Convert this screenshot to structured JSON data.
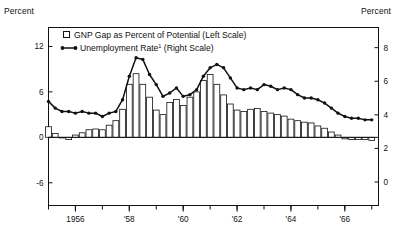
{
  "axis_titles": {
    "left": "Percent",
    "right": "Percent"
  },
  "legend": {
    "items": [
      {
        "label": "GNP Gap as Percent of Potential (Left Scale)",
        "marker": "open-square-icon",
        "color": "#ffffff"
      },
      {
        "label": "Unemployment Rate",
        "footnote": "1",
        "label_tail": " (Right Scale)",
        "marker": "line-with-dots-icon",
        "color": "#111111"
      }
    ]
  },
  "colors": {
    "axis": "#111111",
    "bar_stroke": "#111111",
    "bar_fill": "#ffffff",
    "line": "#111111",
    "marker": "#111111"
  },
  "chart_data": {
    "type": "bar",
    "title": "",
    "xlabel": "",
    "ylabel": "Percent",
    "grid": false,
    "legend_position": "top-left",
    "x_tick_labels": [
      "1956",
      "'58",
      "'60",
      "'62",
      "'64",
      "'66"
    ],
    "x_tick_years": [
      1956,
      1958,
      1960,
      1962,
      1964,
      1966
    ],
    "x_range": [
      1955.0,
      1967.25
    ],
    "left_axis": {
      "label": "GNP Gap as Percent of Potential",
      "ticks": [
        12,
        6,
        0,
        -6
      ],
      "ylim": [
        -9,
        14.5
      ]
    },
    "right_axis": {
      "label": "Unemployment Rate",
      "ticks": [
        8,
        6,
        4,
        2,
        0
      ],
      "ylim": [
        -1.4,
        9.2
      ]
    },
    "x": [
      1955.0,
      1955.25,
      1955.5,
      1955.75,
      1956.0,
      1956.25,
      1956.5,
      1956.75,
      1957.0,
      1957.25,
      1957.5,
      1957.75,
      1958.0,
      1958.25,
      1958.5,
      1958.75,
      1959.0,
      1959.25,
      1959.5,
      1959.75,
      1960.0,
      1960.25,
      1960.5,
      1960.75,
      1961.0,
      1961.25,
      1961.5,
      1961.75,
      1962.0,
      1962.25,
      1962.5,
      1962.75,
      1963.0,
      1963.25,
      1963.5,
      1963.75,
      1964.0,
      1964.25,
      1964.5,
      1964.75,
      1965.0,
      1965.25,
      1965.5,
      1965.75,
      1966.0,
      1966.25,
      1966.5,
      1966.75,
      1967.0
    ],
    "series": [
      {
        "name": "GNP Gap as Percent of Potential (Left Scale)",
        "type": "bar",
        "axis": "left",
        "values": [
          1.4,
          0.5,
          0.0,
          -0.3,
          0.3,
          0.6,
          1.0,
          1.1,
          1.0,
          1.6,
          2.2,
          3.7,
          7.0,
          8.4,
          7.0,
          5.3,
          3.6,
          3.0,
          4.6,
          5.0,
          4.2,
          5.3,
          6.0,
          7.5,
          8.3,
          7.0,
          5.6,
          4.4,
          3.6,
          3.4,
          3.7,
          3.8,
          3.4,
          3.2,
          3.0,
          2.8,
          2.4,
          2.2,
          2.0,
          1.9,
          1.5,
          1.2,
          0.7,
          0.3,
          -0.2,
          -0.3,
          -0.3,
          -0.3,
          -0.4
        ]
      },
      {
        "name": "Unemployment Rate (Right Scale)",
        "type": "line",
        "axis": "right",
        "values": [
          4.8,
          4.4,
          4.2,
          4.2,
          4.1,
          4.2,
          4.1,
          4.1,
          3.9,
          4.1,
          4.2,
          4.9,
          6.3,
          7.4,
          7.3,
          6.4,
          5.8,
          5.1,
          5.3,
          5.6,
          5.1,
          5.2,
          5.5,
          6.3,
          6.8,
          7.0,
          6.8,
          6.2,
          5.6,
          5.5,
          5.6,
          5.5,
          5.8,
          5.7,
          5.5,
          5.6,
          5.5,
          5.2,
          5.0,
          5.0,
          4.9,
          4.7,
          4.4,
          4.1,
          3.9,
          3.8,
          3.8,
          3.7,
          3.7
        ]
      }
    ]
  }
}
